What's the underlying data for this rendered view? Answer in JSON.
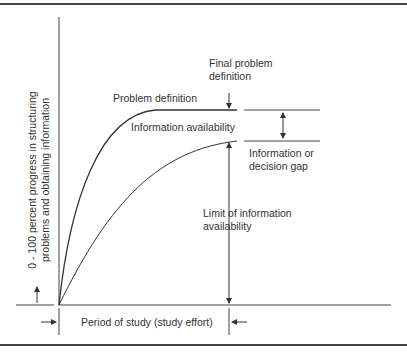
{
  "diagram": {
    "y_axis_label_line1": "0 - 100 percent progress in structuring",
    "y_axis_label_line2": "problems and obtaining information",
    "x_axis_label": "Period of study (study effort)",
    "curves": [
      {
        "name": "Problem definition",
        "label": "Problem definition"
      },
      {
        "name": "Information availability",
        "label": "Information availability"
      }
    ],
    "annotations": {
      "final_problem_line1": "Final problem",
      "final_problem_line2": "definition",
      "gap_line1": "Information or",
      "gap_line2": "decision gap",
      "limit_line1": "Limit of information",
      "limit_line2": "availability"
    }
  }
}
